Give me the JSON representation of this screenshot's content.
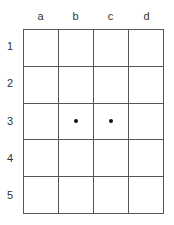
{
  "grid": {
    "columns": [
      "a",
      "b",
      "c",
      "d"
    ],
    "rows": [
      "1",
      "2",
      "3",
      "4",
      "5"
    ],
    "dots": [
      {
        "row": 3,
        "col": "b"
      },
      {
        "row": 3,
        "col": "c"
      }
    ]
  },
  "colors": {
    "line": "#555555",
    "dot": "#111111",
    "label": "#333333"
  }
}
